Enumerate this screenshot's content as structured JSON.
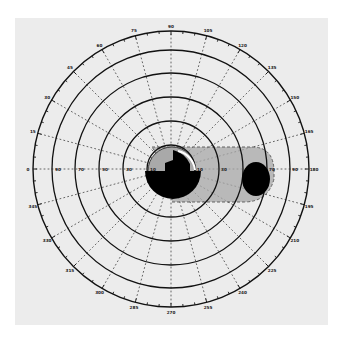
{
  "chart_data": {
    "type": "polar",
    "title": "",
    "center": [
      171,
      169
    ],
    "outer_radius_px": 138,
    "rings_deg": [
      10,
      20,
      30,
      40,
      50,
      60,
      70,
      80,
      90
    ],
    "solid_rings_px": [
      37,
      75,
      110,
      147,
      181,
      138
    ],
    "meridian_step_deg": 15,
    "angle_labels": [
      "0",
      "15",
      "30",
      "45",
      "60",
      "75",
      "90",
      "105",
      "120",
      "135",
      "150",
      "165",
      "180",
      "195",
      "210",
      "225",
      "240",
      "255",
      "270",
      "285",
      "300",
      "315",
      "330",
      "345"
    ],
    "horizontal_axis_labels_left": [
      "90",
      "70",
      "50",
      "30",
      "10"
    ],
    "horizontal_axis_labels_right": [
      "10",
      "30",
      "50",
      "70",
      "90"
    ],
    "scotomas": [
      {
        "name": "central-absolute-scotoma",
        "shape": "irregular",
        "cx": 173,
        "cy": 176,
        "r": 28,
        "fill": "#000000"
      },
      {
        "name": "blind-spot",
        "shape": "ellipse",
        "cx": 256,
        "cy": 179,
        "rx": 14,
        "ry": 17,
        "fill": "#000000"
      },
      {
        "name": "relative-scotoma-band",
        "shape": "rounded-rect-dashed",
        "x": 152,
        "y": 147,
        "w": 122,
        "h": 55,
        "fill": "#9a9a9a"
      }
    ]
  },
  "colors": {
    "paper": "#ececec",
    "ink": "#111111",
    "shade": "#a9a9a9"
  }
}
